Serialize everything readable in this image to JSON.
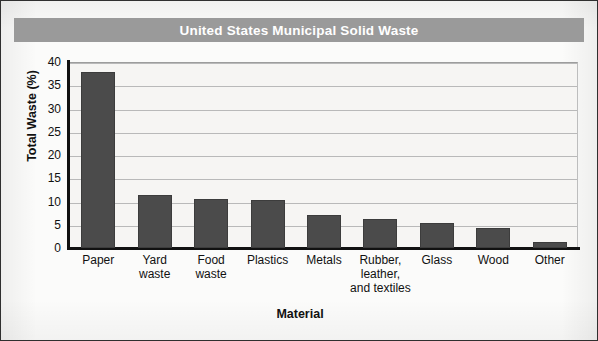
{
  "figure": {
    "title": "United States Municipal Solid Waste",
    "title_bg_color": "#9a9a9a",
    "title_text_color": "#ffffff",
    "bar_color": "#4b4b4b",
    "plot_bg_color": "#f6f5f3",
    "axis_color": "#111111",
    "gridline_color": "#b9b9b9"
  },
  "chart_data": {
    "type": "bar",
    "title": "United States Municipal Solid Waste",
    "xlabel": "Material",
    "ylabel": "Total Waste (%)",
    "ylim": [
      0,
      40
    ],
    "yticks": [
      0,
      5,
      10,
      15,
      20,
      25,
      30,
      35,
      40
    ],
    "ytick_labels": [
      "0",
      "5",
      "10",
      "15",
      "20",
      "25",
      "30",
      "35",
      "40"
    ],
    "grid": true,
    "legend": false,
    "categories": [
      "Paper",
      "Yard waste",
      "Food waste",
      "Plastics",
      "Metals",
      "Rubber, leather, and textiles",
      "Glass",
      "Wood",
      "Other"
    ],
    "category_label_lines": [
      [
        "Paper"
      ],
      [
        "Yard",
        "waste"
      ],
      [
        "Food",
        "waste"
      ],
      [
        "Plastics"
      ],
      [
        "Metals"
      ],
      [
        "Rubber,",
        "leather,",
        "and textiles"
      ],
      [
        "Glass"
      ],
      [
        "Wood"
      ],
      [
        "Other"
      ]
    ],
    "values": [
      37.8,
      11.3,
      10.5,
      10.4,
      7.2,
      6.3,
      5.4,
      4.3,
      1.4
    ]
  }
}
